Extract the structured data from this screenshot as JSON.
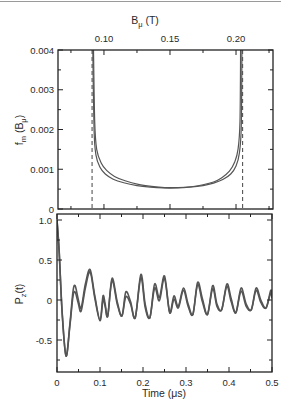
{
  "chart_data": [
    {
      "type": "line",
      "title": "",
      "xlabel_top": "B_μ (T)",
      "xlabel_top_main": "B",
      "xlabel_top_sub": "μ",
      "xlabel_top_unit": " (T)",
      "ylabel": "f_m (B_μ)",
      "ylabel_main": "f",
      "ylabel_sub": "m",
      "ylabel_rest": " (B",
      "ylabel_sub2": "μ",
      "ylabel_end": ")",
      "xlim": [
        0.0652,
        0.228
      ],
      "ylim": [
        0,
        0.004
      ],
      "x_ticks": [
        0.1,
        0.15,
        0.2
      ],
      "x_tick_labels": [
        "0.10",
        "0.15",
        "0.20"
      ],
      "y_ticks": [
        0,
        0.001,
        0.002,
        0.003,
        0.004
      ],
      "y_tick_labels": [
        "0",
        "0.001",
        "0.002",
        "0.003",
        "0.004"
      ],
      "grid": false,
      "legend": null,
      "dashed_lines_x": [
        0.091,
        0.205
      ],
      "series": [
        {
          "name": "outer",
          "x": [
            0.0915,
            0.0925,
            0.094,
            0.097,
            0.101,
            0.107,
            0.115,
            0.125,
            0.135,
            0.145,
            0.155,
            0.165,
            0.175,
            0.183,
            0.19,
            0.196,
            0.2,
            0.2025,
            0.204,
            0.2045
          ],
          "y": [
            0.0042,
            0.002,
            0.00135,
            0.00105,
            0.00088,
            0.00075,
            0.00066,
            0.00059,
            0.00055,
            0.00053,
            0.00053,
            0.00055,
            0.00059,
            0.00065,
            0.00074,
            0.00088,
            0.00108,
            0.0014,
            0.0021,
            0.0042
          ]
        },
        {
          "name": "inner",
          "x": [
            0.092,
            0.093,
            0.0945,
            0.098,
            0.102,
            0.108,
            0.116,
            0.126,
            0.136,
            0.146,
            0.156,
            0.166,
            0.175,
            0.183,
            0.189,
            0.195,
            0.199,
            0.2015,
            0.203,
            0.2035
          ],
          "y": [
            0.0042,
            0.0022,
            0.0015,
            0.00115,
            0.00097,
            0.00082,
            0.00071,
            0.00062,
            0.00057,
            0.00054,
            0.00054,
            0.00056,
            0.00061,
            0.00068,
            0.00078,
            0.00095,
            0.00118,
            0.0015,
            0.0022,
            0.0042
          ]
        }
      ]
    },
    {
      "type": "line",
      "title": "",
      "xlabel": "Time (μs)",
      "ylabel": "P_z(t)",
      "ylabel_main": "P",
      "ylabel_sub": "z",
      "ylabel_rest": "(t)",
      "xlim": [
        0,
        0.5
      ],
      "ylim": [
        -0.9,
        1.15
      ],
      "x_ticks": [
        0,
        0.1,
        0.2,
        0.3,
        0.4,
        0.5
      ],
      "x_tick_labels": [
        "0",
        "0.1",
        "0.2",
        "0.3",
        "0.4",
        "0.5"
      ],
      "y_ticks": [
        -0.5,
        0,
        0.5,
        1.0
      ],
      "y_tick_labels": [
        "-0.5",
        "0",
        "0.5",
        "1.0"
      ],
      "grid": false,
      "legend": null,
      "series": [
        {
          "name": "curve-1",
          "x": [
            0,
            0.005,
            0.012,
            0.021,
            0.03,
            0.037,
            0.042,
            0.049,
            0.056,
            0.066,
            0.077,
            0.088,
            0.1,
            0.107,
            0.112,
            0.118,
            0.128,
            0.14,
            0.151,
            0.16,
            0.171,
            0.182,
            0.195,
            0.205,
            0.216,
            0.227,
            0.238,
            0.25,
            0.262,
            0.272,
            0.282,
            0.294,
            0.305,
            0.316,
            0.327,
            0.338,
            0.35,
            0.362,
            0.372,
            0.383,
            0.395,
            0.405,
            0.416,
            0.428,
            0.44,
            0.452,
            0.463,
            0.474,
            0.486,
            0.497,
            0.5
          ],
          "y": [
            1.0,
            0.62,
            -0.15,
            -0.7,
            -0.3,
            0.1,
            0.18,
            0.02,
            -0.1,
            0.2,
            0.38,
            0.05,
            -0.25,
            0.05,
            -0.05,
            -0.2,
            0.27,
            -0.02,
            -0.2,
            0.1,
            -0.02,
            -0.22,
            0.32,
            -0.05,
            -0.22,
            0.2,
            0.03,
            0.3,
            -0.15,
            0.05,
            -0.08,
            0.15,
            -0.05,
            -0.18,
            0.22,
            0.02,
            -0.18,
            0.18,
            -0.05,
            -0.12,
            0.2,
            0.02,
            -0.16,
            0.15,
            -0.05,
            -0.12,
            0.15,
            0.0,
            -0.1,
            0.12,
            0.05
          ]
        },
        {
          "name": "curve-2",
          "x": [
            0,
            0.005,
            0.012,
            0.021,
            0.03,
            0.037,
            0.042,
            0.049,
            0.056,
            0.066,
            0.077,
            0.088,
            0.1,
            0.107,
            0.112,
            0.118,
            0.128,
            0.14,
            0.151,
            0.16,
            0.171,
            0.182,
            0.195,
            0.205,
            0.216,
            0.227,
            0.238,
            0.25,
            0.262,
            0.272,
            0.282,
            0.294,
            0.305,
            0.316,
            0.327,
            0.338,
            0.35,
            0.362,
            0.372,
            0.383,
            0.395,
            0.405,
            0.416,
            0.428,
            0.44,
            0.452,
            0.463,
            0.474,
            0.486,
            0.497,
            0.5
          ],
          "y": [
            1.0,
            0.6,
            -0.17,
            -0.7,
            -0.32,
            0.04,
            0.1,
            -0.03,
            -0.14,
            0.15,
            0.35,
            0.02,
            -0.26,
            0.0,
            -0.08,
            -0.2,
            0.24,
            -0.05,
            -0.2,
            0.04,
            -0.05,
            -0.22,
            0.28,
            -0.09,
            -0.22,
            0.15,
            -0.01,
            0.27,
            -0.16,
            0.01,
            -0.1,
            0.12,
            -0.08,
            -0.18,
            0.19,
            -0.02,
            -0.18,
            0.14,
            -0.08,
            -0.12,
            0.17,
            -0.02,
            -0.16,
            0.11,
            -0.08,
            -0.12,
            0.12,
            -0.03,
            -0.1,
            0.09,
            0.02
          ]
        }
      ]
    }
  ],
  "colors": {
    "curve": "#555555",
    "axis": "#222222",
    "dashed": "#444444",
    "top_border": "#9a9a9a"
  }
}
